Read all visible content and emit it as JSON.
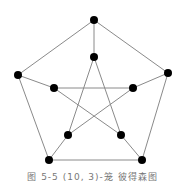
{
  "figure": {
    "caption": "图 5-5  (10, 3)-笼 彼得森图",
    "graph": {
      "name": "Petersen graph",
      "edge_color": "#8a8a8a",
      "node_color": "#000000",
      "node_radius": 4,
      "nodes": [
        {
          "id": "outer-top",
          "x": 94,
          "y": 20
        },
        {
          "id": "outer-right",
          "x": 168,
          "y": 73
        },
        {
          "id": "outer-bottom-right",
          "x": 142,
          "y": 160
        },
        {
          "id": "outer-bottom-left",
          "x": 49,
          "y": 160
        },
        {
          "id": "outer-left",
          "x": 18,
          "y": 75
        },
        {
          "id": "inner-top",
          "x": 94,
          "y": 57
        },
        {
          "id": "inner-right",
          "x": 133,
          "y": 88
        },
        {
          "id": "inner-bottom-right",
          "x": 121,
          "y": 135
        },
        {
          "id": "inner-bottom-left",
          "x": 68,
          "y": 135
        },
        {
          "id": "inner-left",
          "x": 54,
          "y": 88
        }
      ],
      "edges": [
        [
          "outer-top",
          "outer-right"
        ],
        [
          "outer-right",
          "outer-bottom-right"
        ],
        [
          "outer-bottom-right",
          "outer-bottom-left"
        ],
        [
          "outer-bottom-left",
          "outer-left"
        ],
        [
          "outer-left",
          "outer-top"
        ],
        [
          "outer-top",
          "inner-top"
        ],
        [
          "outer-right",
          "inner-right"
        ],
        [
          "outer-bottom-right",
          "inner-bottom-right"
        ],
        [
          "outer-bottom-left",
          "inner-bottom-left"
        ],
        [
          "outer-left",
          "inner-left"
        ],
        [
          "inner-top",
          "inner-bottom-left"
        ],
        [
          "inner-top",
          "inner-bottom-right"
        ],
        [
          "inner-left",
          "inner-right"
        ],
        [
          "inner-left",
          "inner-bottom-right"
        ],
        [
          "inner-right",
          "inner-bottom-left"
        ]
      ]
    }
  }
}
